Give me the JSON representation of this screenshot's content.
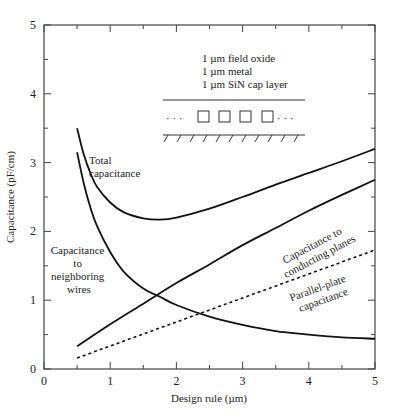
{
  "chart_data": {
    "type": "line",
    "title": "",
    "xlabel": "Design rule (µm)",
    "ylabel": "Capacitance (pF/cm)",
    "xlim": [
      0,
      5
    ],
    "ylim": [
      0,
      5
    ],
    "xticks": [
      "0",
      "1",
      "2",
      "3",
      "4",
      "5"
    ],
    "yticks": [
      "0",
      "1",
      "2",
      "3",
      "4",
      "5"
    ],
    "grid": false,
    "legend": "none (inline annotations)",
    "series": [
      {
        "name": "Total capacitance",
        "style": "solid",
        "x": [
          0.5,
          0.6,
          0.7,
          0.8,
          1.0,
          1.2,
          1.5,
          1.75,
          2.0,
          2.5,
          3.0,
          3.5,
          4.0,
          4.5,
          5.0
        ],
        "y": [
          3.5,
          3.12,
          2.85,
          2.65,
          2.42,
          2.28,
          2.19,
          2.17,
          2.2,
          2.33,
          2.5,
          2.68,
          2.85,
          3.02,
          3.2
        ]
      },
      {
        "name": "Capacitance to neighboring wires",
        "style": "solid",
        "x": [
          0.5,
          0.6,
          0.7,
          0.8,
          1.0,
          1.2,
          1.5,
          1.75,
          2.0,
          2.5,
          3.0,
          3.5,
          4.0,
          4.5,
          5.0
        ],
        "y": [
          3.15,
          2.7,
          2.35,
          2.08,
          1.7,
          1.42,
          1.17,
          1.05,
          0.93,
          0.76,
          0.64,
          0.55,
          0.5,
          0.46,
          0.44
        ]
      },
      {
        "name": "Capacitance to conducting planes",
        "style": "solid",
        "x": [
          0.5,
          1.0,
          1.5,
          2.0,
          2.5,
          3.0,
          3.5,
          4.0,
          4.5,
          5.0
        ],
        "y": [
          0.33,
          0.65,
          0.95,
          1.25,
          1.52,
          1.8,
          2.05,
          2.3,
          2.53,
          2.75
        ]
      },
      {
        "name": "Parallel-plate capacitance",
        "style": "dotted",
        "x": [
          0.5,
          5.0
        ],
        "y": [
          0.16,
          1.73
        ]
      }
    ],
    "annotations": [
      {
        "text": "Total capacitance",
        "x": 0.75,
        "y": 3.05
      },
      {
        "text": "Capacitance to neighboring wires",
        "x": 0.2,
        "y": 1.5
      },
      {
        "text": "Capacitance to conducting planes",
        "x": 3.9,
        "y": 2.1,
        "rotation": -28
      },
      {
        "text": "Parallel-plate capacitance",
        "x": 4.0,
        "y": 1.2,
        "rotation": -20
      }
    ]
  },
  "inset": {
    "lines": [
      "1 µm field oxide",
      "1 µm metal",
      "1 µm SiN cap layer"
    ],
    "ellipsis": "· · ·",
    "wire_count": 4
  },
  "labels": {
    "total": [
      "Total",
      "capacitance"
    ],
    "neighbor": [
      "Capacitance",
      "to",
      "neighboring",
      "wires"
    ],
    "planes": [
      "Capacitance to",
      "conducting planes"
    ],
    "parallel": [
      "Parallel-plate",
      "capacitance"
    ]
  }
}
